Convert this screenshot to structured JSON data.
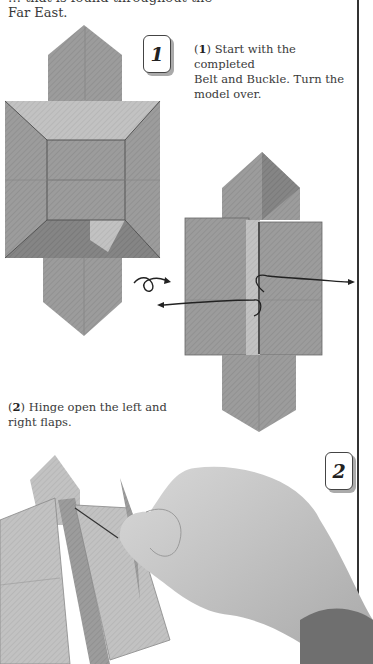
{
  "page": {
    "intro_cut_line": "… that is found throughout the",
    "intro_last_line": "Far East."
  },
  "steps": [
    {
      "number": "1",
      "number_label": "1",
      "caption_lines": [
        "Start with the completed",
        "Belt and Buckle. Turn the",
        "model over."
      ],
      "caption_prefix": "(",
      "caption_num": "1",
      "caption_suffix": ")"
    },
    {
      "number": "2",
      "number_label": "2",
      "caption_lines": [
        "Hinge open the left and",
        "right flaps."
      ],
      "caption_prefix": "(",
      "caption_num": "2",
      "caption_suffix": ")"
    }
  ],
  "colors": {
    "paper": "#9a9a9a",
    "paper_light": "#c4c4c4",
    "paper_dark": "#7c7c7c",
    "ink": "#222222",
    "rule": "#333333",
    "skin": "#c9c9c9"
  },
  "icons": [
    "turn-over-icon",
    "arrow-left-icon",
    "arrow-right-icon"
  ]
}
